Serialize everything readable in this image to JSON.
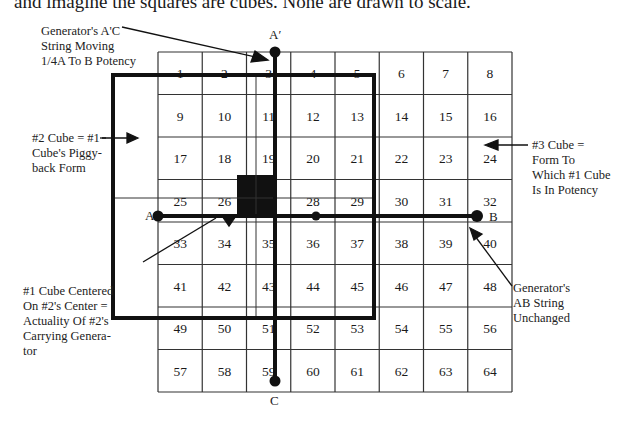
{
  "intro_text": "and imagine the squares are cubes. None are drawn to scale.",
  "grid": {
    "rows": 8,
    "cols": 8,
    "cells": [
      1,
      2,
      3,
      4,
      5,
      6,
      7,
      8,
      9,
      10,
      11,
      12,
      13,
      14,
      15,
      16,
      17,
      18,
      19,
      20,
      21,
      22,
      23,
      24,
      25,
      26,
      27,
      28,
      29,
      30,
      31,
      32,
      33,
      34,
      35,
      36,
      37,
      38,
      39,
      40,
      41,
      42,
      43,
      44,
      45,
      46,
      47,
      48,
      49,
      50,
      51,
      52,
      53,
      54,
      55,
      56,
      57,
      58,
      59,
      60,
      61,
      62,
      63,
      64
    ],
    "filled_cell": 27
  },
  "points": {
    "a_prime": "A′",
    "a": "A",
    "b": "B",
    "c": "C"
  },
  "annotations": {
    "top_left": [
      "Generator's A'C",
      "String Moving",
      "1/4A To B Potency"
    ],
    "left": [
      "#2 Cube = #1",
      "Cube's Piggy-",
      "back Form"
    ],
    "right": [
      "#3 Cube =",
      "Form To",
      "Which #1 Cube",
      "Is In Potency"
    ],
    "bottom_left": [
      "#1 Cube Centered",
      "On #2's Center =",
      "Actuality Of #2's",
      "Carrying Genera-",
      "tor"
    ],
    "bottom_right": [
      "Generator's",
      "AB String",
      "Unchanged"
    ]
  },
  "colors": {
    "line": "#1a1a1a",
    "grid_line": "#333333",
    "background": "#ffffff"
  }
}
